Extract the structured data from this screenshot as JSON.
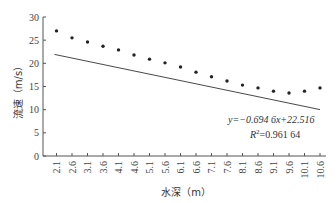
{
  "chart_data": {
    "type": "scatter",
    "title": "",
    "xlabel": "水深（m）",
    "ylabel": "流速（m/s）",
    "ylim": [
      0,
      30
    ],
    "yticks": [
      0,
      5,
      10,
      15,
      20,
      25,
      30
    ],
    "x": [
      "2.1",
      "2.6",
      "3.1",
      "3.6",
      "4.1",
      "4.6",
      "5.1",
      "5.6",
      "6.1",
      "6.6",
      "7.1",
      "7.6",
      "8.1",
      "8.6",
      "9.1",
      "9.6",
      "10.1",
      "10.6"
    ],
    "series": [
      {
        "name": "流速",
        "values": [
          27.0,
          25.5,
          24.6,
          23.7,
          22.9,
          21.8,
          20.9,
          20.1,
          19.2,
          18.1,
          17.1,
          16.2,
          15.3,
          14.7,
          14.0,
          13.6,
          14.0,
          14.7
        ]
      }
    ],
    "trendline": {
      "type": "linear",
      "equation": "y=−0.694 6x+22.516",
      "r2": "R²=0.961 64",
      "slope": -0.6946,
      "intercept": 22.516
    },
    "grid": false,
    "legend": "none"
  },
  "labels": {
    "equation": "y=−0.694 6x+22.516",
    "r2_prefix": "R",
    "r2_value": "=0.961 64"
  },
  "colors": {
    "axis": "#555555",
    "points": "#222222",
    "trendline": "#333333"
  }
}
